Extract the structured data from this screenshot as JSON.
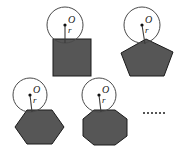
{
  "figure": {
    "kind": "geometry-diagram",
    "background_color": "#ffffff",
    "polygon_fill_color": "#565656",
    "polygon_stroke_color": "#1a1a1a",
    "circle_stroke_color": "#4a4a4a",
    "label_color": "#1a1a1a",
    "center_label": "O",
    "radius_label": "r",
    "continuation_marker": "......",
    "continuation_dot_count": 6,
    "panels": [
      {
        "id": "panel-square",
        "shape_name": "square",
        "sides": 4,
        "center_label": "O",
        "radius_label": "r"
      },
      {
        "id": "panel-pentagon",
        "shape_name": "pentagon",
        "sides": 5,
        "center_label": "O",
        "radius_label": "r"
      },
      {
        "id": "panel-hexagon",
        "shape_name": "hexagon",
        "sides": 6,
        "center_label": "O",
        "radius_label": "r"
      },
      {
        "id": "panel-octagon",
        "shape_name": "octagon",
        "sides": 8,
        "center_label": "O",
        "radius_label": "r"
      }
    ]
  }
}
